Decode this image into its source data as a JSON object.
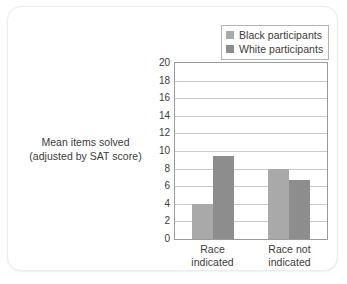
{
  "chart_data": {
    "type": "bar",
    "title": "",
    "subtitle": "",
    "xlabel": "",
    "ylabel": "Mean items solved (adjusted by SAT score)",
    "ylabel_lines": [
      "Mean items solved",
      "(adjusted by SAT score)"
    ],
    "categories": [
      "Race indicated",
      "Race not indicated"
    ],
    "category_lines": [
      [
        "Race",
        "indicated"
      ],
      [
        "Race not",
        "indicated"
      ]
    ],
    "series": [
      {
        "name": "Black participants",
        "color": "#a9a9a9",
        "values": [
          4.0,
          8.0
        ]
      },
      {
        "name": "White participants",
        "color": "#8d8d8d",
        "values": [
          9.4,
          6.7
        ]
      }
    ],
    "ylim": [
      0,
      20
    ],
    "ytick_step": 2,
    "yticks": [
      20,
      18,
      16,
      14,
      12,
      10,
      8,
      6,
      4,
      2,
      0
    ],
    "ytick_labels": [
      "20",
      "18",
      "16",
      "14",
      "12",
      "10",
      "8",
      "6",
      "4",
      "2",
      "0"
    ],
    "grid": true,
    "grid_axis": "y",
    "legend_position": "top-right",
    "legend_entries": [
      "Black participants",
      "White participants"
    ]
  },
  "legend": {
    "entries": [
      {
        "label": "Black participants",
        "color": "#a9a9a9"
      },
      {
        "label": "White participants",
        "color": "#8d8d8d"
      }
    ]
  },
  "axes": {
    "y_title_line1": "Mean items solved",
    "y_title_line2": "(adjusted by SAT score)"
  },
  "colors": {
    "series_black_participants": "#a9a9a9",
    "series_white_participants": "#8d8d8d",
    "gridline": "#c9c9c9",
    "axis_border": "#9a9a9a",
    "text": "#3b3b3b",
    "card_border": "#ececec"
  }
}
